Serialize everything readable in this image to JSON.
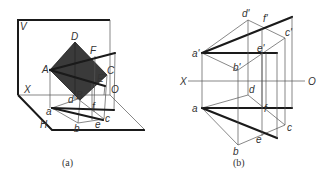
{
  "figure_a": {
    "caption": "(a)",
    "labels": {
      "V": "V",
      "H": "H",
      "X": "X",
      "O": "O",
      "A": "A",
      "B": "B",
      "C": "C",
      "D": "D",
      "E": "E",
      "F": "F",
      "a": "a",
      "b": "b",
      "c": "c",
      "d": "d",
      "e": "e",
      "f": "f"
    }
  },
  "figure_b": {
    "caption": "(b)",
    "labels": {
      "X": "X",
      "O": "O",
      "a_prime": "a'",
      "b_prime": "b'",
      "c_prime": "c'",
      "d_prime": "d'",
      "e_prime": "e'",
      "f_prime": "f'",
      "a": "a",
      "b": "b",
      "c": "c",
      "d": "d",
      "e": "e",
      "f": "f"
    }
  },
  "colors": {
    "ink": "#1a1a1a",
    "fill": "#3a3a3a",
    "background": "#ffffff"
  }
}
